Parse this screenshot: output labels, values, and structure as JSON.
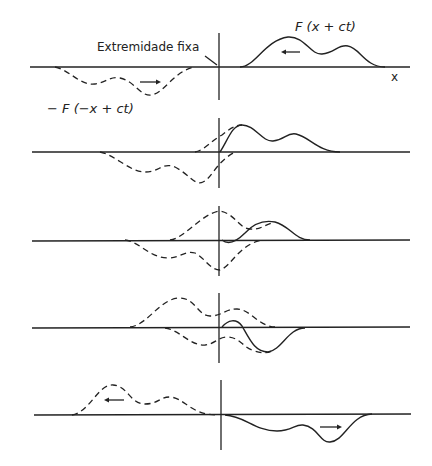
{
  "labels": {
    "fixed_end": "Extremidade fixa",
    "forward_wave": "F (x + ct)",
    "reflected_wave": "− F (−x + ct)",
    "x_axis": "x"
  },
  "panels": [
    {
      "stage": 1,
      "description": "incident pulse approaching fixed end; inverted image pulse on left"
    },
    {
      "stage": 2,
      "description": "pulses begin to overlap at fixed end"
    },
    {
      "stage": 3,
      "description": "maximum overlap; superposition near zero at end"
    },
    {
      "stage": 4,
      "description": "resultant becomes inverted"
    },
    {
      "stage": 5,
      "description": "inverted reflected pulse travels right"
    }
  ]
}
